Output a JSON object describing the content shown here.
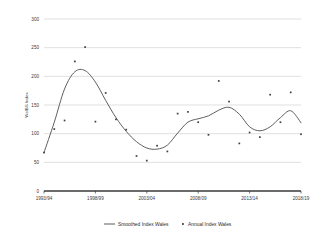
{
  "chart_data": {
    "type": "scatter",
    "title": "",
    "xlabel": "",
    "ylabel": "WelBS Index",
    "ylim": [
      0,
      300
    ],
    "yticks": [
      0,
      50,
      100,
      150,
      200,
      250,
      300
    ],
    "grid": true,
    "legend_position": "bottom",
    "x": [
      "1993/94",
      "1994/95",
      "1995/96",
      "1996/97",
      "1997/98",
      "1998/99",
      "1999/00",
      "2000/01",
      "2001/02",
      "2002/03",
      "2003/04",
      "2004/05",
      "2005/06",
      "2006/07",
      "2007/08",
      "2008/09",
      "2009/10",
      "2010/11",
      "2011/12",
      "2012/13",
      "2013/14",
      "2014/15",
      "2015/16",
      "2016/17",
      "2017/18",
      "2018/19"
    ],
    "xtick_labels": [
      "1993/94",
      "1998/99",
      "2003/04",
      "2008/09",
      "2013/14",
      "2018/19"
    ],
    "xtick_indices": [
      0,
      5,
      10,
      15,
      20,
      25
    ],
    "series": [
      {
        "name": "Annual Index Wales",
        "kind": "scatter",
        "marker": "square",
        "color": "#3f3f3f",
        "values": [
          67,
          108,
          123,
          226,
          251,
          121,
          171,
          125,
          107,
          61,
          53,
          79,
          69,
          135,
          138,
          120,
          98,
          192,
          156,
          83,
          102,
          94,
          168,
          120,
          172,
          99
        ]
      },
      {
        "name": "Smoothed Index Wales",
        "kind": "line",
        "color": "#555555",
        "values": [
          67,
          120,
          178,
          208,
          210,
          190,
          158,
          128,
          104,
          86,
          75,
          73,
          80,
          101,
          120,
          126,
          131,
          141,
          146,
          134,
          112,
          105,
          112,
          128,
          140,
          119
        ]
      }
    ],
    "legend": [
      {
        "label": "Smoothed Index Wales",
        "type": "line",
        "color": "#555555"
      },
      {
        "label": "Annual Index Wales",
        "type": "marker",
        "color": "#3f3f3f"
      }
    ],
    "style": {
      "gridline_color": "#d3d3d3",
      "axis_color": "#3a3a3a",
      "background": "#ffffff"
    }
  }
}
